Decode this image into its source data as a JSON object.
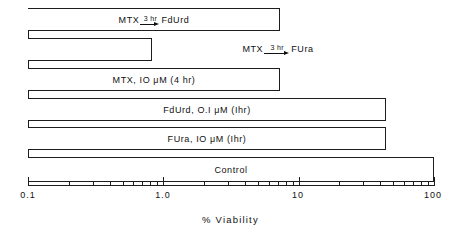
{
  "chart_data": {
    "type": "bar",
    "orientation": "horizontal",
    "title": "",
    "subtitle": "",
    "xlabel": "% Viability",
    "ylabel": "",
    "xscale": "log",
    "xlim": [
      0.1,
      100
    ],
    "grid": false,
    "legend": null,
    "categories": [
      "MTX 3hr FdUrd",
      "MTX 3hr FUra",
      "MTX, 10 μM (4 hr)",
      "FdUrd, 0.1 μM (1hr)",
      "FUra, 10 μM (1hr)",
      "Control"
    ],
    "values": [
      4.6,
      0.82,
      4.6,
      46,
      46,
      100
    ],
    "axis_tick_labels": [
      "0.1",
      "1.0",
      "10",
      "100"
    ],
    "axis_tick_values": [
      0.1,
      1.0,
      10,
      100
    ],
    "minor_tick_values": [
      0.2,
      0.3,
      0.4,
      0.5,
      0.6,
      0.7,
      0.8,
      0.9,
      2,
      3,
      4,
      5,
      6,
      7,
      8,
      9,
      20,
      30,
      40,
      50,
      60,
      70,
      80,
      90
    ]
  },
  "bars": [
    {
      "name": "mtx-fdurd",
      "value": 4.6,
      "label_kind": "reaction",
      "label_pre": "MTX",
      "label_duration": "3 hr",
      "label_post": "FdUrd",
      "label_plain": "MTX → 3 hr → FdUrd",
      "label_inside": true
    },
    {
      "name": "mtx-fura",
      "value": 0.82,
      "label_kind": "reaction",
      "label_pre": "MTX",
      "label_duration": "3 hr",
      "label_post": "FUra",
      "label_plain": "MTX → 3 hr → FUra",
      "label_inside": false
    },
    {
      "name": "mtx-only",
      "value": 4.6,
      "label_kind": "plain",
      "label_plain": "MTX, IO μM (4 hr)",
      "label_inside": true
    },
    {
      "name": "fdurd-only",
      "value": 46,
      "label_kind": "plain",
      "label_plain": "FdUrd, O.I μM (Ihr)",
      "label_inside": true
    },
    {
      "name": "fura-only",
      "value": 46,
      "label_kind": "plain",
      "label_plain": "FUra, IO μM (Ihr)",
      "label_inside": true
    },
    {
      "name": "control",
      "value": 100,
      "label_kind": "plain",
      "label_plain": "Control",
      "label_inside": true
    }
  ],
  "axis": {
    "title": "% Viability",
    "tick_0": "0.1",
    "tick_1": "1.0",
    "tick_2": "10",
    "tick_3": "100"
  },
  "colors": {
    "ink": "#1d1d1d",
    "background": "#ffffff"
  }
}
